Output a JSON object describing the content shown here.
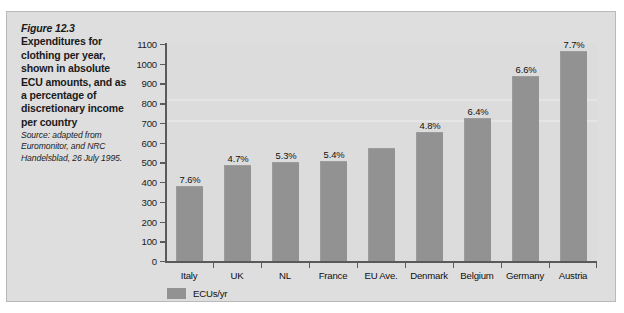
{
  "figure": {
    "number": "Figure 12.3",
    "title": "Expenditures for clothing per year, shown in absolute ECU amounts, and as a percentage of discretionary income per country",
    "source": "Source: adapted from Euromonitor, and NRC Handelsblad, 26 July 1995."
  },
  "legend": {
    "label": "ECUs/yr",
    "swatch_color": "#929292"
  },
  "colors": {
    "panel_background": "#dedede",
    "plot_background": "#dcdcdc",
    "bar_fill": "#929292",
    "axis_line": "#5a5a5a",
    "text": "#101010"
  },
  "chart_data": {
    "type": "bar",
    "title": "Expenditures for clothing per year",
    "xlabel": "",
    "ylabel": "",
    "ylim": [
      0,
      1100
    ],
    "ytick_step": 100,
    "grid": false,
    "legend_position": "bottom-left",
    "categories": [
      "Italy",
      "UK",
      "NL",
      "France",
      "EU Ave.",
      "Denmark",
      "Belgium",
      "Germany",
      "Austria"
    ],
    "series": [
      {
        "name": "ECUs/yr",
        "values": [
          375,
          480,
          495,
          500,
          570,
          650,
          720,
          935,
          1060
        ]
      }
    ],
    "ytick_labels": [
      "0",
      "100",
      "200",
      "300",
      "400",
      "500",
      "600",
      "700",
      "800",
      "900",
      "1000",
      "1100"
    ],
    "point_labels": [
      "7.6%",
      "4.7%",
      "5.3%",
      "5.4%",
      "",
      "4.8%",
      "6.4%",
      "6.6%",
      "7.7%"
    ],
    "point_label_note": "Percentage of discretionary income per country; EU Ave. has no percentage label"
  }
}
